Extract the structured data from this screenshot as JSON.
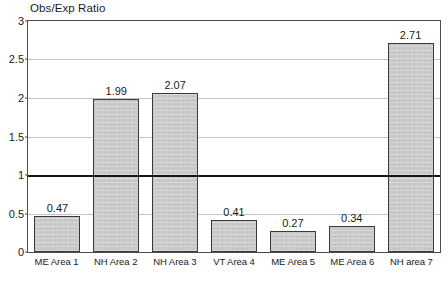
{
  "chart_data": {
    "type": "bar",
    "title": "Obs/Exp Ratio",
    "xlabel": "",
    "ylabel": "",
    "ylim": [
      0,
      3
    ],
    "yticks": [
      "0",
      "0.5",
      "1",
      "1.5",
      "2",
      "2.5",
      "3"
    ],
    "ytick_values": [
      0,
      0.5,
      1,
      1.5,
      2,
      2.5,
      3
    ],
    "grid": true,
    "legend": null,
    "categories": [
      "ME Area 1",
      "NH Area 2",
      "NH Area 3",
      "VT Area 4",
      "ME Area 5",
      "ME Area 6",
      "NH area 7"
    ],
    "values": [
      0.47,
      1.99,
      2.07,
      0.41,
      0.27,
      0.34,
      2.71
    ],
    "value_labels": [
      "0.47",
      "1.99",
      "2.07",
      "0.41",
      "0.27",
      "0.34",
      "2.71"
    ],
    "reference_line": {
      "value": 1,
      "label": "1.0",
      "color": "#151515",
      "style": "solid-thick"
    },
    "colors": {
      "bar_fill": "#c9c9c9",
      "bar_border": "#3a3a3a",
      "gridline": "#c4c4c4",
      "axis": "#4d4d4d",
      "text": "#1a1a1a",
      "background": "#ffffff"
    }
  }
}
